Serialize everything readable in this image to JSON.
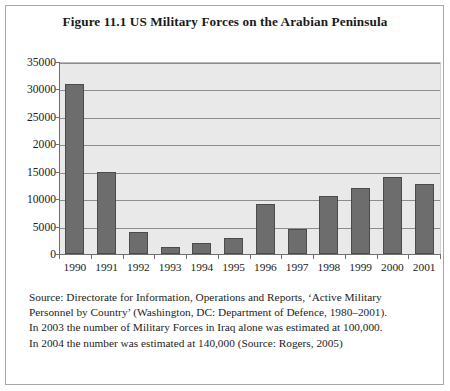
{
  "figure": {
    "title": "Figure 11.1 US Military Forces on the Arabian Peninsula"
  },
  "footnote": {
    "lines": [
      "Source: Directorate for Information, Operations and Reports, ‘Active Military",
      "Personnel by Country’ (Washington, DC: Department of Defence, 1980–2001).",
      "In 2003 the number of Military Forces in Iraq alone was estimated at 100,000.",
      "In 2004 the number was estimated at 140,000 (Source: Rogers, 2005)"
    ]
  },
  "colors": {
    "bar_fill": "#6e6d6d",
    "bar_edge": "#4c4b4b",
    "plot_background": "#e9e9e9",
    "gridline": "#8d8d8d",
    "axis": "#6f6f6f",
    "frame_border": "#a8a8a8",
    "text": "#1d1d1d"
  },
  "chart_data": {
    "type": "bar",
    "title": "Figure 11.1 US Military Forces on the Arabian Peninsula",
    "xlabel": "",
    "ylabel": "",
    "categories": [
      "1990",
      "1991",
      "1992",
      "1993",
      "1994",
      "1995",
      "1996",
      "1997",
      "1998",
      "1999",
      "2000",
      "2001"
    ],
    "values": [
      31000,
      15000,
      4000,
      1200,
      2000,
      3000,
      9200,
      4500,
      10500,
      12000,
      14000,
      12700
    ],
    "ylim": [
      0,
      35000
    ],
    "ytick_values": [
      0,
      5000,
      10000,
      15000,
      20000,
      25000,
      30000,
      35000
    ],
    "ytick_labels": [
      "0",
      "5000",
      "10000",
      "15000",
      "2000",
      "25000",
      "30000",
      "35000"
    ],
    "grid": true,
    "legend": false,
    "note": "The tick label at 20000 is printed as '2000' in the source figure."
  }
}
